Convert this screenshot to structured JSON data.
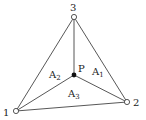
{
  "diagram": {
    "vertices": [
      {
        "id": "1",
        "label": "1"
      },
      {
        "id": "2",
        "label": "2"
      },
      {
        "id": "3",
        "label": "3"
      }
    ],
    "interior_point": {
      "label": "P"
    },
    "areas": [
      {
        "base": "A",
        "sub": "1"
      },
      {
        "base": "A",
        "sub": "2"
      },
      {
        "base": "A",
        "sub": "3"
      }
    ],
    "colors": {
      "stroke": "#333333",
      "point": "#111111"
    }
  }
}
